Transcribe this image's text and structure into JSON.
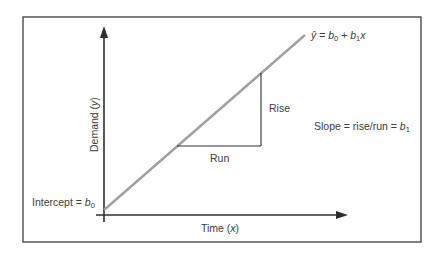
{
  "diagram": {
    "equation": {
      "lhs": "ŷ",
      "eq": " = ",
      "b0": "b",
      "b0_sub": "0",
      "plus": " + ",
      "b1": "b",
      "b1_sub": "1",
      "x": "x"
    },
    "axes": {
      "x_label_text": "Time (",
      "x_label_var": "x",
      "x_label_close": ")",
      "y_label_text": "Demand (",
      "y_label_var": "y",
      "y_label_close": ")"
    },
    "annotations": {
      "rise": "Rise",
      "run": "Run",
      "slope_text": "Slope = rise/run = ",
      "slope_var": "b",
      "slope_sub": "1",
      "intercept_text": "Intercept = ",
      "intercept_var": "b",
      "intercept_sub": "0"
    },
    "colors": {
      "line": "#a0a0a0",
      "axes": "#2e2e2e",
      "frame": "#4a4a4a",
      "text": "#3c3c3c"
    }
  }
}
